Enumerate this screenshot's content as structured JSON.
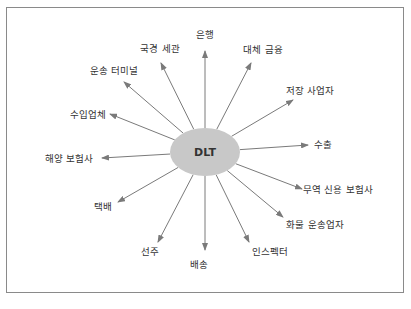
{
  "diagram": {
    "type": "hub-and-spoke",
    "center": {
      "label": "DLT",
      "x": 205,
      "y": 152,
      "rx": 35,
      "ry": 24,
      "fill": "#c8c8c8"
    },
    "arrow_color": "#7a7a7a",
    "nodes": [
      {
        "label": "은행",
        "lx": 205,
        "ly": 35,
        "tx": 205,
        "ty": 51
      },
      {
        "label": "대체 금융",
        "lx": 263,
        "ly": 50,
        "tx": 251,
        "ty": 63
      },
      {
        "label": "저장 사업자",
        "lx": 310,
        "ly": 91,
        "tx": 293,
        "ty": 100
      },
      {
        "label": "수출",
        "lx": 323,
        "ly": 145,
        "tx": 308,
        "ty": 145
      },
      {
        "label": "무역 신용 보험사",
        "lx": 338,
        "ly": 190,
        "tx": 302,
        "ty": 189
      },
      {
        "label": "화물 운송업자",
        "lx": 315,
        "ly": 225,
        "tx": 283,
        "ty": 217
      },
      {
        "label": "인스펙터",
        "lx": 270,
        "ly": 252,
        "tx": 249,
        "ty": 242
      },
      {
        "label": "배송",
        "lx": 199,
        "ly": 265,
        "tx": 205,
        "ty": 250
      },
      {
        "label": "선주",
        "lx": 150,
        "ly": 252,
        "tx": 158,
        "ty": 242
      },
      {
        "label": "택배",
        "lx": 103,
        "ly": 207,
        "tx": 118,
        "ty": 202
      },
      {
        "label": "해양 보험사",
        "lx": 69,
        "ly": 159,
        "tx": 102,
        "ty": 158
      },
      {
        "label": "수입업체",
        "lx": 88,
        "ly": 115,
        "tx": 110,
        "ty": 114
      },
      {
        "label": "운송 터미널",
        "lx": 114,
        "ly": 71,
        "tx": 124,
        "ty": 82
      },
      {
        "label": "국경 세관",
        "lx": 160,
        "ly": 49,
        "tx": 161,
        "ty": 63
      }
    ]
  },
  "caption": {
    "text": ""
  }
}
